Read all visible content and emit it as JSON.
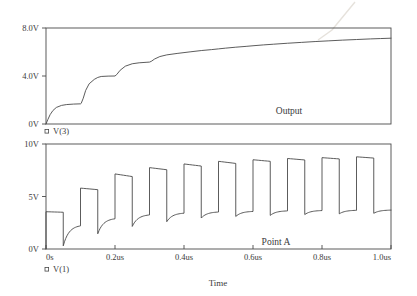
{
  "figure": {
    "kind": "spice-transient-analysis",
    "background_color": "#ffffff",
    "trace_color": "#4a4a4a",
    "text_color": "#3a3a3a"
  },
  "xaxis": {
    "title": "Time",
    "ticks": [
      "0s",
      "0.2us",
      "0.4us",
      "0.6us",
      "0.8us",
      "1.0us"
    ],
    "min_us": 0.0,
    "max_us": 1.0
  },
  "upper_plot": {
    "trace_label": "Output",
    "legend_marker": "square-marker",
    "legend_label": "V(3)",
    "yticks": [
      "8.0V",
      "4.0V",
      "0V"
    ],
    "ymin": 0.0,
    "ymax": 8.0
  },
  "lower_plot": {
    "trace_label": "Point A",
    "legend_marker": "square-marker",
    "legend_label": "V(1)",
    "yticks": [
      "10V",
      "5V",
      "0V"
    ],
    "ymin": 0.0,
    "ymax": 10.0
  },
  "chart_data": {
    "type": "line",
    "title": "",
    "xlabel": "Time",
    "ylabel": "",
    "panels": [
      {
        "name": "upper",
        "trace_label": "Output",
        "legend": "V(3)",
        "ylabel": "",
        "ylim": [
          0,
          8
        ],
        "xlim": [
          0,
          1.0
        ],
        "ytick_values": [
          0,
          4.0,
          8.0
        ],
        "ytick_labels": [
          "0V",
          "4.0V",
          "8.0V"
        ],
        "grid": false,
        "series": [
          {
            "name": "V(3)",
            "x": [
              0.0,
              0.005,
              0.012,
              0.02,
              0.03,
              0.045,
              0.06,
              0.08,
              0.1,
              0.102,
              0.108,
              0.115,
              0.125,
              0.14,
              0.15,
              0.16,
              0.18,
              0.2,
              0.205,
              0.215,
              0.23,
              0.25,
              0.27,
              0.29,
              0.3,
              0.305,
              0.315,
              0.33,
              0.35,
              0.38,
              0.4,
              0.42,
              0.45,
              0.48,
              0.5,
              0.52,
              0.55,
              0.58,
              0.6,
              0.63,
              0.66,
              0.7,
              0.74,
              0.78,
              0.82,
              0.86,
              0.9,
              0.94,
              0.97,
              1.0
            ],
            "y": [
              0.0,
              0.35,
              0.78,
              1.12,
              1.38,
              1.55,
              1.62,
              1.66,
              1.68,
              1.72,
              2.15,
              2.8,
              3.35,
              3.72,
              3.88,
              3.96,
              3.99,
              4.0,
              4.12,
              4.48,
              4.82,
              5.02,
              5.1,
              5.14,
              5.16,
              5.22,
              5.42,
              5.62,
              5.76,
              5.88,
              5.95,
              6.02,
              6.12,
              6.2,
              6.26,
              6.32,
              6.4,
              6.47,
              6.52,
              6.59,
              6.65,
              6.73,
              6.8,
              6.87,
              6.93,
              6.99,
              7.04,
              7.09,
              7.12,
              7.15
            ]
          }
        ]
      },
      {
        "name": "lower",
        "trace_label": "Point A",
        "legend": "V(1)",
        "ylabel": "",
        "ylim": [
          0,
          10
        ],
        "xlim": [
          0,
          1.0
        ],
        "ytick_values": [
          0,
          5,
          10
        ],
        "ytick_labels": [
          "0V",
          "5V",
          "10V"
        ],
        "grid": false,
        "pulse_count": 10,
        "period_us": 0.1,
        "description": "Square pulse train with exponential droop on each level; high and low levels ratchet upward over time toward a settled swing.",
        "pulse_levels": [
          {
            "index": 1,
            "high_start": 3.55,
            "high_end": 3.5,
            "low_start": 0.3,
            "low_end": 2.3
          },
          {
            "index": 2,
            "high_start": 5.8,
            "high_end": 5.65,
            "low_start": 1.45,
            "low_end": 2.95
          },
          {
            "index": 3,
            "high_start": 7.15,
            "high_end": 6.9,
            "low_start": 2.15,
            "low_end": 3.3
          },
          {
            "index": 4,
            "high_start": 7.75,
            "high_end": 7.55,
            "low_start": 2.6,
            "low_end": 3.45
          },
          {
            "index": 5,
            "high_start": 8.1,
            "high_end": 7.9,
            "low_start": 2.95,
            "low_end": 3.55
          },
          {
            "index": 6,
            "high_start": 8.35,
            "high_end": 8.15,
            "low_start": 3.1,
            "low_end": 3.6
          },
          {
            "index": 7,
            "high_start": 8.5,
            "high_end": 8.35,
            "low_start": 3.2,
            "low_end": 3.65
          },
          {
            "index": 8,
            "high_start": 8.62,
            "high_end": 8.48,
            "low_start": 3.28,
            "low_end": 3.68
          },
          {
            "index": 9,
            "high_start": 8.7,
            "high_end": 8.58,
            "low_start": 3.35,
            "low_end": 3.7
          },
          {
            "index": 10,
            "high_start": 8.78,
            "high_end": 8.66,
            "low_start": 3.4,
            "low_end": 3.72
          }
        ]
      }
    ]
  }
}
